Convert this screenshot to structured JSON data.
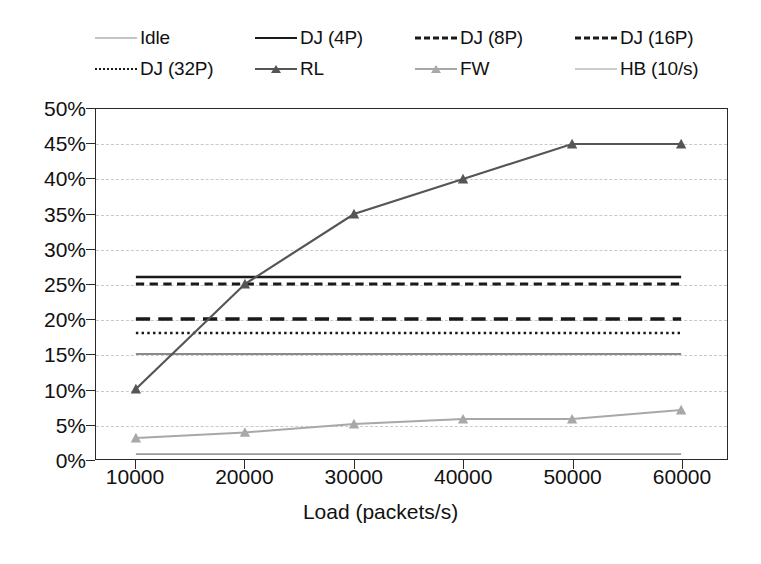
{
  "chart_data": {
    "type": "line",
    "title": "",
    "xlabel": "Load (packets/s)",
    "ylabel": "",
    "x": [
      10000,
      20000,
      30000,
      40000,
      50000,
      60000
    ],
    "xtick_labels": [
      "10000",
      "20000",
      "30000",
      "40000",
      "50000",
      "60000"
    ],
    "ytick_labels": [
      "0%",
      "5%",
      "10%",
      "15%",
      "20%",
      "25%",
      "30%",
      "35%",
      "40%",
      "45%",
      "50%"
    ],
    "ytick_values": [
      0,
      5,
      10,
      15,
      20,
      25,
      30,
      35,
      40,
      45,
      50
    ],
    "ylim": [
      0,
      50
    ],
    "xlim": [
      10000,
      60000
    ],
    "grid": "horizontal-dashed",
    "legend_position": "top",
    "units": "percent",
    "series": [
      {
        "name": "Idle",
        "values": [
          15,
          15,
          15,
          15,
          15,
          15
        ],
        "color": "#8a8a8a",
        "style": "solid",
        "width": 1.8,
        "marker": "none"
      },
      {
        "name": "DJ (4P)",
        "values": [
          26,
          26,
          26,
          26,
          26,
          26
        ],
        "color": "#1a1a1a",
        "style": "solid",
        "width": 2.6,
        "marker": "none"
      },
      {
        "name": "DJ (8P)",
        "values": [
          25,
          25,
          25,
          25,
          25,
          25
        ],
        "color": "#1a1a1a",
        "style": "dashed",
        "width": 3.2,
        "marker": "none"
      },
      {
        "name": "DJ (16P)",
        "values": [
          20,
          20,
          20,
          20,
          20,
          20
        ],
        "color": "#1a1a1a",
        "style": "long-dash",
        "width": 3.4,
        "marker": "none"
      },
      {
        "name": "DJ (32P)",
        "values": [
          18,
          18,
          18,
          18,
          18,
          18
        ],
        "color": "#1a1a1a",
        "style": "dotted",
        "width": 2.6,
        "marker": "none"
      },
      {
        "name": "RL",
        "values": [
          10,
          25,
          35,
          40,
          45,
          45
        ],
        "color": "#555555",
        "style": "solid",
        "width": 2.2,
        "marker": "triangle"
      },
      {
        "name": "FW",
        "values": [
          3,
          3.8,
          5,
          5.7,
          5.7,
          7
        ],
        "color": "#a8a8a8",
        "style": "solid",
        "width": 2.0,
        "marker": "triangle"
      },
      {
        "name": "HB (10/s)",
        "values": [
          0.7,
          0.7,
          0.7,
          0.7,
          0.7,
          0.7
        ],
        "color": "#9a9a9a",
        "style": "solid",
        "width": 1.8,
        "marker": "none"
      }
    ]
  },
  "legend": {
    "rows": [
      [
        "Idle",
        "DJ (4P)",
        "DJ (8P)",
        "DJ (16P)"
      ],
      [
        "DJ (32P)",
        "RL",
        "FW",
        "HB (10/s)"
      ]
    ]
  },
  "colors": {
    "axis": "#2a2a2a",
    "grid": "#c9c9c9",
    "background": "#ffffff",
    "text": "#111111"
  }
}
